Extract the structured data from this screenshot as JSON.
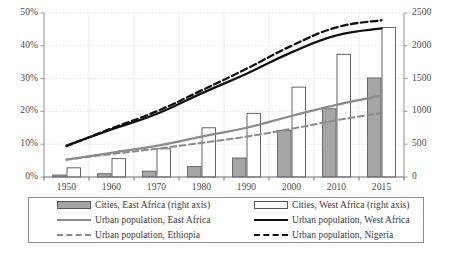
{
  "chart_data": {
    "type": "bar",
    "title": "",
    "subtitle": "",
    "xlabel": "",
    "ylabel": "",
    "grid": true,
    "legend_position": "bottom",
    "categories": [
      "1950",
      "1960",
      "1970",
      "1980",
      "1990",
      "2000",
      "2010",
      "2015"
    ],
    "axes": {
      "left": {
        "label": "",
        "ticks": [
          "0%",
          "10%",
          "20%",
          "30%",
          "40%",
          "50%"
        ],
        "values": [
          0,
          10,
          20,
          30,
          40,
          50
        ],
        "min": 0,
        "max": 50,
        "unit": "%"
      },
      "right": {
        "label": "",
        "ticks": [
          "0",
          "500",
          "1000",
          "1500",
          "2000",
          "2500"
        ],
        "values": [
          0,
          500,
          1000,
          1500,
          2000,
          2500
        ],
        "min": 0,
        "max": 2500,
        "unit": ""
      }
    },
    "series": [
      {
        "name": "Cities, East Africa (right axis)",
        "type": "bar",
        "axis": "right",
        "style": "filled-gray",
        "color": "#a6a6a6",
        "values": [
          30,
          50,
          90,
          160,
          290,
          710,
          1040,
          1510
        ]
      },
      {
        "name": "Cities, West Africa (right axis)",
        "type": "bar",
        "axis": "right",
        "style": "outline-white",
        "color": "#ffffff",
        "values": [
          140,
          280,
          430,
          750,
          970,
          1370,
          1870,
          2280
        ]
      },
      {
        "name": "Urban population, East Africa",
        "type": "line",
        "axis": "left",
        "style": "solid",
        "color": "#8a8a8a",
        "values": [
          5.3,
          7.4,
          9.5,
          12.3,
          15.0,
          18.6,
          22.0,
          24.8
        ]
      },
      {
        "name": "Urban population, West Africa",
        "type": "line",
        "axis": "left",
        "style": "solid",
        "color": "#111111",
        "values": [
          9.6,
          14.5,
          19.2,
          25.5,
          31.5,
          38.0,
          43.2,
          45.3
        ]
      },
      {
        "name": "Urban population, Ethiopia",
        "type": "line",
        "axis": "left",
        "style": "dashed",
        "color": "#8a8a8a",
        "values": [
          5.3,
          7.0,
          8.6,
          10.4,
          12.3,
          14.7,
          17.3,
          19.5
        ]
      },
      {
        "name": "Urban population, Nigeria",
        "type": "line",
        "axis": "left",
        "style": "dashed",
        "color": "#111111",
        "values": [
          9.4,
          14.8,
          20.0,
          26.4,
          33.0,
          40.0,
          45.6,
          47.8
        ]
      }
    ]
  },
  "legend": {
    "items": [
      {
        "label": "Cities, East Africa (right axis)",
        "swatch": "bar-gray"
      },
      {
        "label": "Cities, West Africa (right axis)",
        "swatch": "bar-white"
      },
      {
        "label": "Urban population, East Africa",
        "swatch": "line-gray"
      },
      {
        "label": "Urban population, West Africa",
        "swatch": "line-black"
      },
      {
        "label": "Urban population, Ethiopia",
        "swatch": "dash-gray"
      },
      {
        "label": "Urban population, Nigeria",
        "swatch": "dash-black"
      }
    ]
  },
  "colors": {
    "bar_east": "#a6a6a6",
    "bar_east_border": "#555555",
    "bar_west": "#ffffff",
    "bar_west_border": "#555555",
    "line_east": "#8a8a8a",
    "line_west": "#111111",
    "line_ethiopia": "#8a8a8a",
    "line_nigeria": "#111111",
    "grid": "#d9d9d9",
    "axis": "#9a9a9a",
    "text": "#3a3a3a"
  }
}
